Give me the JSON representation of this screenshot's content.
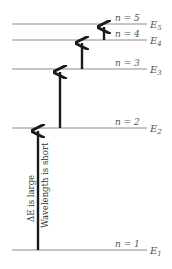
{
  "diagram": {
    "levels": [
      {
        "n_label": "n = 5",
        "e_label": "E",
        "e_sub": "5",
        "y": 24
      },
      {
        "n_label": "n = 4",
        "e_label": "E",
        "e_sub": "4",
        "y": 40
      },
      {
        "n_label": "n = 3",
        "e_label": "E",
        "e_sub": "3",
        "y": 69
      },
      {
        "n_label": "n = 2",
        "e_label": "E",
        "e_sub": "2",
        "y": 128
      },
      {
        "n_label": "n = 1",
        "e_label": "E",
        "e_sub": "1",
        "y": 250
      }
    ],
    "annotation_line1": "ΔE is large",
    "annotation_line2": "Wavelength is short",
    "colors": {
      "level_line": "#8a8a8a",
      "arrow": "#1a1a1a",
      "text": "#555555"
    }
  }
}
